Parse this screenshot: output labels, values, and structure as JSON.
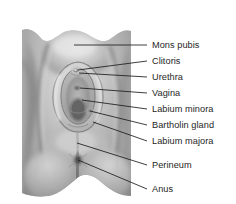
{
  "figure": {
    "style": "grayscale medical illustration",
    "colors": {
      "background": "#ffffff",
      "skin_light": "#e9e9e9",
      "skin_mid": "#b6b6b6",
      "skin_dark": "#7d7d7d",
      "skin_darkest": "#555555",
      "leader_line": "#1c1c1c",
      "label_text": "#262626"
    }
  },
  "annotations": [
    {
      "id": "mons-pubis",
      "label": "Mons pubis",
      "text_x": 152,
      "text_y": 41,
      "line_x1": 147,
      "line_y1": 45,
      "line_x2": 74,
      "line_y2": 45
    },
    {
      "id": "clitoris",
      "label": "Clitoris",
      "text_x": 152,
      "text_y": 57,
      "line_x1": 147,
      "line_y1": 61,
      "line_x2": 78,
      "line_y2": 70
    },
    {
      "id": "urethra",
      "label": "Urethra",
      "text_x": 152,
      "text_y": 73,
      "line_x1": 147,
      "line_y1": 77,
      "line_x2": 79,
      "line_y2": 73
    },
    {
      "id": "vagina",
      "label": "Vagina",
      "text_x": 152,
      "text_y": 89,
      "line_x1": 147,
      "line_y1": 93,
      "line_x2": 80,
      "line_y2": 88
    },
    {
      "id": "labium-minora",
      "label": "Labium minora",
      "text_x": 152,
      "text_y": 105,
      "line_x1": 147,
      "line_y1": 109,
      "line_x2": 82,
      "line_y2": 100
    },
    {
      "id": "bartholin-gland",
      "label": "Bartholin gland",
      "text_x": 152,
      "text_y": 121,
      "line_x1": 147,
      "line_y1": 125,
      "line_x2": 90,
      "line_y2": 111
    },
    {
      "id": "labium-majora",
      "label": "Labium majora",
      "text_x": 152,
      "text_y": 137,
      "line_x1": 147,
      "line_y1": 141,
      "line_x2": 93,
      "line_y2": 122
    },
    {
      "id": "perineum",
      "label": "Perineum",
      "text_x": 152,
      "text_y": 161,
      "line_x1": 147,
      "line_y1": 165,
      "line_x2": 77,
      "line_y2": 143
    },
    {
      "id": "anus",
      "label": "Anus",
      "text_x": 152,
      "text_y": 185,
      "line_x1": 147,
      "line_y1": 189,
      "line_x2": 78,
      "line_y2": 160
    }
  ]
}
